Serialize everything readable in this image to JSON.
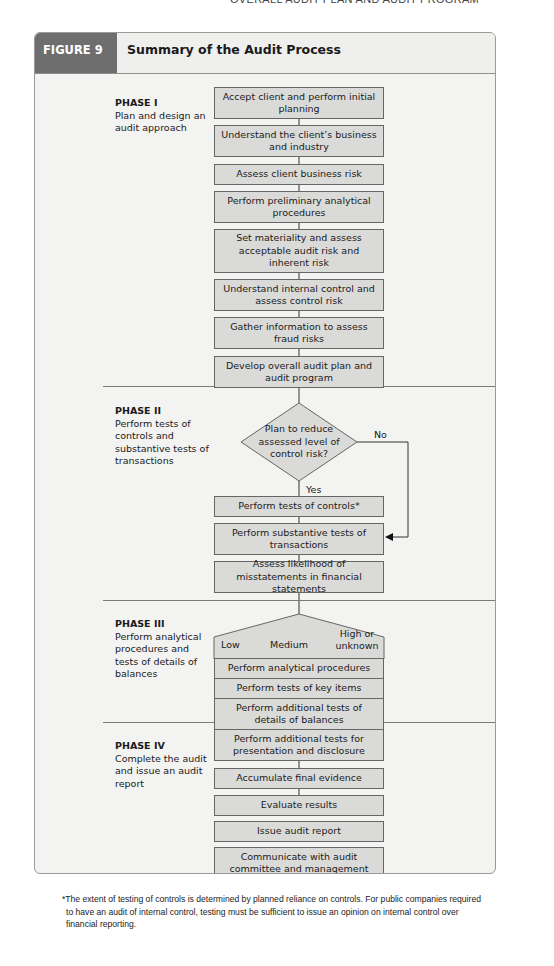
{
  "running_head": "OVERALL AUDIT PLAN AND AUDIT PROGRAM",
  "figure": {
    "label": "FIGURE 9",
    "title": "Summary of the Audit Process"
  },
  "phases": [
    {
      "title": "PHASE I",
      "description": "Plan and design an audit approach"
    },
    {
      "title": "PHASE II",
      "description": "Perform tests of controls and substantive tests of transactions"
    },
    {
      "title": "PHASE III",
      "description": "Perform analytical procedures and tests of details of balances"
    },
    {
      "title": "PHASE IV",
      "description": "Complete the audit and issue an audit report"
    }
  ],
  "phase1_steps": [
    "Accept client and perform initial planning",
    "Understand the client’s business and industry",
    "Assess client business risk",
    "Perform preliminary analytical procedures",
    "Set materiality and assess acceptable audit risk and inherent risk",
    "Understand internal control and assess control risk",
    "Gather information to assess fraud risks",
    "Develop overall audit plan and audit program"
  ],
  "phase2": {
    "decision": "Plan to reduce assessed level of control risk?",
    "yes_label": "Yes",
    "no_label": "No",
    "steps": [
      "Perform tests of controls*",
      "Perform substantive tests of transactions",
      "Assess likelihood of misstatements in financial statements"
    ]
  },
  "phase3": {
    "levels": [
      "Low",
      "Medium",
      "High or unknown"
    ],
    "steps": [
      "Perform analytical procedures",
      "Perform tests of key items",
      "Perform additional tests of details of balances"
    ]
  },
  "phase4_steps": [
    "Perform additional tests for presentation and disclosure",
    "Accumulate final evidence",
    "Evaluate results",
    "Issue audit report",
    "Communicate with audit committee and management"
  ],
  "footnote": "*The extent of testing of controls is determined by planned reliance on controls. For public companies required to have an audit of internal control, testing must be sufficient to issue an opinion on internal control over financial reporting.",
  "colors": {
    "label_band": "#6e6e6e",
    "box_fill": "#dadad9",
    "panel_bg": "#f3f3f2"
  }
}
